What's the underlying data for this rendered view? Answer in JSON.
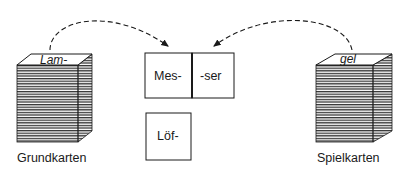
{
  "left_stack": {
    "top_card_text": "Lam-",
    "label": "Grundkarten"
  },
  "right_stack": {
    "top_card_text": "gel",
    "label": "Spielkarten"
  },
  "cards": [
    {
      "text": "Mes-"
    },
    {
      "text": "-ser"
    },
    {
      "text": "Löf-"
    }
  ],
  "colors": {
    "ink": "#1a1a1a",
    "background": "#ffffff"
  }
}
